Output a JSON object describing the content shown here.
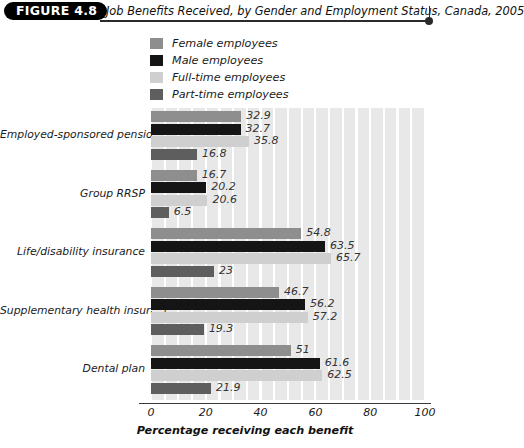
{
  "figure": {
    "badge": "FIGURE 4.8",
    "title": "Job Benefits Received, by Gender and Employment Status, Canada, 2005"
  },
  "legend": {
    "position": "top-left",
    "items": [
      {
        "label": "Female employees",
        "color": "#8e8e8e"
      },
      {
        "label": "Male employees",
        "color": "#151515"
      },
      {
        "label": "Full-time employees",
        "color": "#cfcfcf"
      },
      {
        "label": "Part-time employees",
        "color": "#5e5e5e"
      }
    ]
  },
  "chart_data": {
    "type": "bar",
    "orientation": "horizontal",
    "title": "Job Benefits Received, by Gender and Employment Status, Canada, 2005",
    "xlabel": "Percentage receiving each benefit",
    "ylabel": "",
    "xlim": [
      0,
      100
    ],
    "xticks": [
      0,
      20,
      40,
      60,
      80,
      100
    ],
    "grid": "vertical-bands",
    "categories": [
      "Employed-sponsored pension",
      "Group RRSP",
      "Life/disability insurance",
      "Supplementary health insurance",
      "Dental plan"
    ],
    "series": [
      {
        "name": "Female employees",
        "color": "#8e8e8e",
        "values": [
          32.9,
          16.7,
          54.8,
          46.7,
          51
        ],
        "labels": [
          "32.9",
          "16.7",
          "54.8",
          "46.7",
          "51"
        ]
      },
      {
        "name": "Male employees",
        "color": "#151515",
        "values": [
          32.7,
          20.2,
          63.5,
          56.2,
          61.6
        ],
        "labels": [
          "32.7",
          "20.2",
          "63.5",
          "56.2",
          "61.6"
        ]
      },
      {
        "name": "Full-time employees",
        "color": "#cfcfcf",
        "values": [
          35.8,
          20.6,
          65.7,
          57.2,
          62.5
        ],
        "labels": [
          "35.8",
          "20.6",
          "65.7",
          "57.2",
          "62.5"
        ]
      },
      {
        "name": "Part-time employees",
        "color": "#5e5e5e",
        "values": [
          16.8,
          6.5,
          23,
          19.3,
          21.9
        ],
        "labels": [
          "16.8",
          "6.5",
          "23",
          "19.3",
          "21.9"
        ]
      }
    ]
  }
}
